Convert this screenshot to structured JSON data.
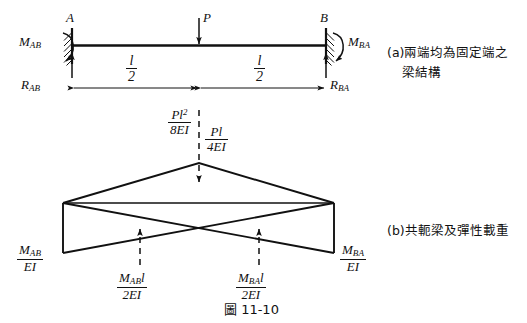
{
  "figure": {
    "number_label": "圖 11-10",
    "panel_a_caption_line1": "(a)兩端均為固定端之",
    "panel_a_caption_line2": "梁結構",
    "panel_b_caption": "(b)共軛梁及彈性載重"
  },
  "beam": {
    "node_a": "A",
    "node_b": "B",
    "load": "P",
    "moment_left_M": "M",
    "moment_left_sub": "AB",
    "moment_right_M": "M",
    "moment_right_sub": "BA",
    "reaction_left_R": "R",
    "reaction_left_sub": "AB",
    "reaction_right_R": "R",
    "reaction_right_sub": "BA",
    "span_left_num": "l",
    "span_left_den": "2",
    "span_right_num": "l",
    "span_right_den": "2"
  },
  "conjugate": {
    "peak_moment_num": "Pl",
    "peak_moment_sup": "2",
    "peak_moment_den": "8EI",
    "peak_load_num": "Pl",
    "peak_load_den": "4EI",
    "left_ordinate_num_M": "M",
    "left_ordinate_num_sub": "AB",
    "left_ordinate_den": "EI",
    "right_ordinate_num_M": "M",
    "right_ordinate_num_sub": "BA",
    "right_ordinate_den": "EI",
    "left_elastic_num_M": "M",
    "left_elastic_num_sub": "AB",
    "left_elastic_num_tail": "l",
    "left_elastic_den": "2EI",
    "right_elastic_num_M": "M",
    "right_elastic_num_sub": "BA",
    "right_elastic_num_tail": "l",
    "right_elastic_den": "2EI"
  },
  "colors": {
    "ink": "#111111",
    "background": "#ffffff"
  }
}
